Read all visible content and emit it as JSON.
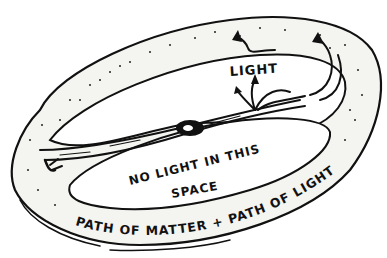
{
  "diagram": {
    "labels": {
      "light": "LIGHT",
      "inner": [
        "NO LIGHT IN THIS",
        "SPACE"
      ],
      "band_text": "PATH OF MATTER + PATH OF LIGHT"
    },
    "elements": [
      {
        "name": "outer-band",
        "description": "Twisted dotted ring band"
      },
      {
        "name": "central-knot",
        "description": "Dark knot at center where band crosses"
      },
      {
        "name": "light-arrows",
        "description": "Curved arrows emanating near center labeled LIGHT"
      },
      {
        "name": "upper-arrow",
        "description": "Arrow in upper band pointing up-left"
      },
      {
        "name": "right-arrow",
        "description": "Arrow in right band pointing up"
      }
    ],
    "colors": {
      "ink": "#111111",
      "paper": "#ffffff",
      "band_fill": "#f4f4f0"
    }
  }
}
